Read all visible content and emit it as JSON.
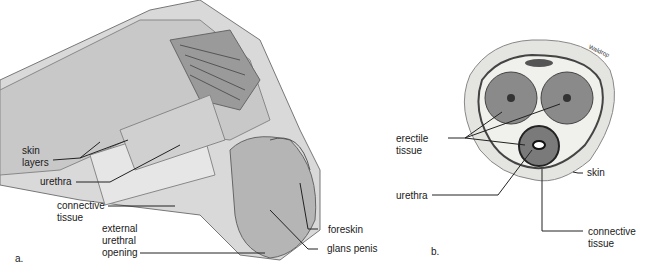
{
  "figure": {
    "panel_a": {
      "letter": "a.",
      "labels": {
        "skin_layers": "skin\nlayers",
        "urethra": "urethra",
        "connective_tissue": "connective\ntissue",
        "external_urethral_opening": "external\nurethral\nopening",
        "foreskin": "foreskin",
        "glans_penis": "glans penis"
      }
    },
    "panel_b": {
      "letter": "b.",
      "signature": "Waldrop",
      "labels": {
        "erectile_tissue": "erectile\ntissue",
        "urethra": "urethra",
        "skin": "skin",
        "connective_tissue": "connective\ntissue"
      }
    }
  }
}
